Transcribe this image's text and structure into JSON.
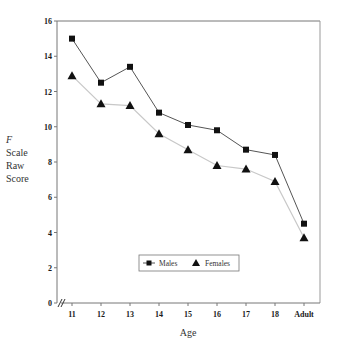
{
  "chart_data": {
    "type": "line",
    "title": "",
    "xlabel": "Age",
    "ylabel": [
      "F",
      "Scale",
      "Raw",
      "Score"
    ],
    "categories": [
      "11",
      "12",
      "13",
      "14",
      "15",
      "16",
      "17",
      "18",
      "Adult"
    ],
    "series": [
      {
        "name": "Males",
        "marker": "square",
        "line_color": "#555555",
        "values": [
          15.0,
          12.5,
          13.4,
          10.8,
          10.1,
          9.8,
          8.7,
          8.4,
          4.5
        ]
      },
      {
        "name": "Females",
        "marker": "triangle",
        "line_color": "#c8c8c8",
        "values": [
          12.9,
          11.3,
          11.2,
          9.6,
          8.7,
          7.8,
          7.6,
          6.9,
          3.7
        ]
      }
    ],
    "ylim": [
      0,
      16
    ],
    "yticks": [
      0,
      2,
      4,
      6,
      8,
      10,
      12,
      14,
      16
    ],
    "grid": false,
    "legend_position": "inside-bottom-center",
    "axis_break": "x-axis break mark (//) near origin"
  }
}
